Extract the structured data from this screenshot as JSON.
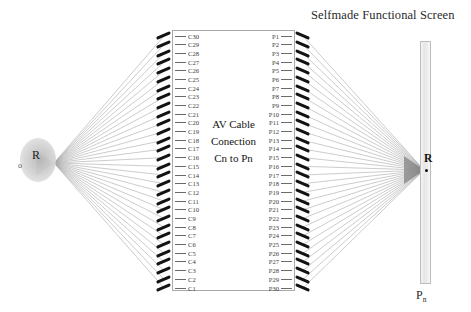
{
  "title": "Selfmade Functional Screen",
  "source": {
    "label": "R",
    "marker": "o"
  },
  "screen": {
    "label": "R",
    "bottom_label_main": "P",
    "bottom_label_sub": "n"
  },
  "module": {
    "caption_lines": [
      "AV Cable",
      "Conection",
      "Cn to Pn"
    ],
    "left_pins": [
      "C30",
      "C29",
      "C28",
      "C27",
      "C26",
      "C25",
      "C24",
      "C23",
      "C22",
      "C21",
      "C20",
      "C19",
      "C18",
      "C17",
      "C16",
      "C15",
      "C14",
      "C13",
      "C12",
      "C11",
      "C10",
      "C9",
      "C8",
      "C7",
      "C6",
      "C5",
      "C4",
      "C3",
      "C2",
      "C1"
    ],
    "right_pins": [
      "P1",
      "P2",
      "P3",
      "P4",
      "P5",
      "P6",
      "P7",
      "P8",
      "P9",
      "P10",
      "P11",
      "P12",
      "P13",
      "P14",
      "P15",
      "P16",
      "P17",
      "P18",
      "P19",
      "P20",
      "P21",
      "P22",
      "P23",
      "P24",
      "P25",
      "P26",
      "P27",
      "P28",
      "P29",
      "P30"
    ],
    "pin_count": 30
  },
  "colors": {
    "ray": "#a9a9a9",
    "pin_tick": "#131313",
    "box_border": "#a9a9a9",
    "text": "#1c1c1c",
    "screen_fill": "#ededed"
  },
  "geometry": {
    "source_point_x": 54,
    "source_point_y": 163,
    "screen_point_x": 424,
    "screen_point_y": 170,
    "left_col_x": 164,
    "right_col_x": 303,
    "pins_top_y": 36,
    "pins_bottom_y": 288
  }
}
